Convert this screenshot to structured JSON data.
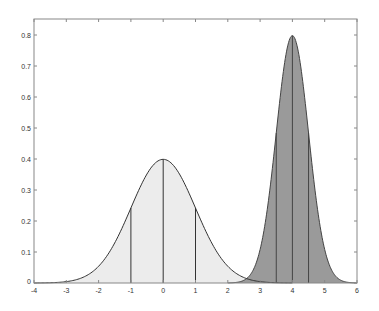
{
  "chart_data": {
    "type": "area",
    "title": "",
    "xlabel": "",
    "ylabel": "",
    "xlim": [
      -4,
      6
    ],
    "ylim": [
      0,
      0.85
    ],
    "grid": false,
    "legend": null,
    "x_ticks": [
      "-4",
      "-3",
      "-2",
      "-1",
      "0",
      "1",
      "2",
      "3",
      "4",
      "5",
      "6"
    ],
    "y_ticks": [
      "0",
      "0.1",
      "0.2",
      "0.3",
      "0.4",
      "0.5",
      "0.6",
      "0.7",
      "0.8"
    ],
    "series": [
      {
        "name": "Normal(mean=0, sd=1)",
        "mean": 0,
        "sd": 1,
        "peak": 0.399,
        "fill": "#ececec",
        "stroke": "#333333",
        "vertical_lines_at": [
          -1,
          0,
          1
        ]
      },
      {
        "name": "Normal(mean=4, sd=0.5)",
        "mean": 4,
        "sd": 0.5,
        "peak": 0.798,
        "fill": "#9a9a9a",
        "stroke": "#444444",
        "vertical_lines_at": [
          3.5,
          4,
          4.5
        ]
      }
    ]
  },
  "colors": {
    "axis": "#888888",
    "background": "#ffffff"
  }
}
